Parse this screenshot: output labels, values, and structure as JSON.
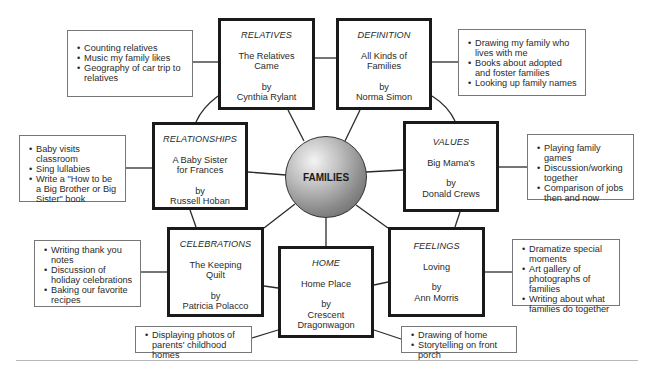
{
  "center": {
    "label": "FAMILIES"
  },
  "books": {
    "relatives": {
      "theme": "RELATIVES",
      "title": "The Relatives\nCame",
      "by": "by",
      "author": "Cynthia Rylant"
    },
    "definition": {
      "theme": "DEFINITION",
      "title": "All Kinds of\nFamilies",
      "by": "by",
      "author": "Norma Simon"
    },
    "relationships": {
      "theme": "RELATIONSHIPS",
      "title": "A Baby Sister\nfor Frances",
      "by": "by",
      "author": "Russell Hoban"
    },
    "values": {
      "theme": "VALUES",
      "title": "Big Mama's",
      "by": "by",
      "author": "Donald Crews"
    },
    "celebrations": {
      "theme": "CELEBRATIONS",
      "title": "The Keeping\nQuilt",
      "by": "by",
      "author": "Patricia Polacco"
    },
    "home": {
      "theme": "HOME",
      "title": "Home Place",
      "by": "by",
      "author": "Crescent\nDragonwagon"
    },
    "feelings": {
      "theme": "FEELINGS",
      "title": "Loving",
      "by": "by",
      "author": "Ann Morris"
    }
  },
  "activities": {
    "relatives": [
      "Counting relatives",
      "Music my family likes",
      "Geography of car trip to relatives"
    ],
    "definition": [
      "Drawing my family who lives with me",
      "Books about adopted and foster families",
      "Looking up family names"
    ],
    "relationships": [
      "Baby visits classroom",
      "Sing lullabies",
      "Write a \"How to be a Big Brother or Big Sister\" book"
    ],
    "values": [
      "Playing family games",
      "Discussion/working together",
      "Comparison of jobs then and now"
    ],
    "celebrations": [
      "Writing thank you notes",
      "Discussion of holiday celebrations",
      "Baking our favorite recipes"
    ],
    "home_left": [
      "Displaying photos of parents' childhood homes"
    ],
    "home_right": [
      "Drawing of home",
      "Storytelling on front porch"
    ],
    "feelings": [
      "Dramatize special moments",
      "Art gallery of photographs of families",
      "Writing about what families do together"
    ]
  },
  "colors": {
    "book_border": "#1a1a1a",
    "activity_border": "#777777",
    "hub_dark": "#5a5a5a",
    "hub_light": "#f4f4f4"
  }
}
